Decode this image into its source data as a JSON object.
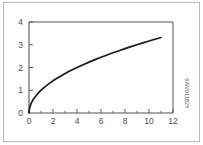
{
  "figure": {
    "id_code": "SAND1182Y",
    "background_color": "#ffffff",
    "border_color": "#b9b9b9",
    "axis_color": "#555555",
    "curve_color": "#1a1a1a",
    "tick_label_color": "#4a4a4a"
  },
  "chart_data": {
    "type": "line",
    "title": "",
    "subtitle": "",
    "xlabel": "",
    "ylabel": "",
    "xlim": [
      0,
      12
    ],
    "ylim": [
      0,
      4
    ],
    "grid": false,
    "legend": null,
    "x_ticks_major": [
      0,
      2,
      4,
      6,
      8,
      10,
      12
    ],
    "x_tick_labels": [
      "0",
      "2",
      "4",
      "6",
      "8",
      "10",
      "12"
    ],
    "x_ticks_minor": [
      1,
      3,
      5,
      7,
      9,
      11
    ],
    "y_ticks_major": [
      0,
      1,
      2,
      3,
      4
    ],
    "y_tick_labels": [
      "0",
      "1",
      "2",
      "3",
      "4"
    ],
    "y_ticks_minor": [],
    "annotations": [],
    "series": [
      {
        "name": "y = sqrt(x)",
        "x": [
          0,
          0.05,
          0.1,
          0.2,
          0.3,
          0.4,
          0.5,
          0.7,
          0.9,
          1.1,
          1.4,
          1.7,
          2.0,
          2.4,
          2.8,
          3.2,
          3.6,
          4.0,
          4.5,
          5.0,
          5.5,
          6.0,
          6.5,
          7.0,
          7.5,
          8.0,
          8.5,
          9.0,
          9.5,
          10.0,
          10.5,
          11.0
        ],
        "y": [
          0,
          0.224,
          0.316,
          0.447,
          0.548,
          0.632,
          0.707,
          0.837,
          0.949,
          1.049,
          1.183,
          1.304,
          1.414,
          1.549,
          1.673,
          1.789,
          1.897,
          2.0,
          2.121,
          2.236,
          2.345,
          2.449,
          2.55,
          2.646,
          2.739,
          2.828,
          2.915,
          3.0,
          3.082,
          3.162,
          3.24,
          3.317
        ]
      }
    ]
  }
}
